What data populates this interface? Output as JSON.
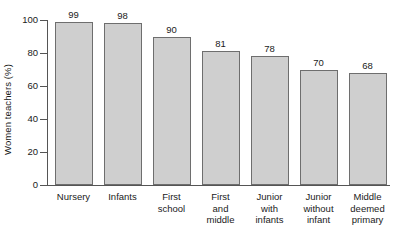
{
  "chart_data": {
    "type": "bar",
    "title": "",
    "xlabel": "",
    "ylabel": "Women teachers (%)",
    "ylim": [
      0,
      100
    ],
    "yticks": [
      0,
      20,
      40,
      60,
      80,
      100
    ],
    "grid": false,
    "legend": false,
    "categories": [
      "Nursery",
      "Infants",
      "First school",
      "First and middle",
      "Junior with infants",
      "Junior without infant",
      "Middle deemed primary"
    ],
    "category_lines": [
      [
        "Nursery"
      ],
      [
        "Infants"
      ],
      [
        "First",
        "school"
      ],
      [
        "First",
        "and",
        "middle"
      ],
      [
        "Junior",
        "with",
        "infants"
      ],
      [
        "Junior",
        "without",
        "infant"
      ],
      [
        "Middle",
        "deemed",
        "primary"
      ]
    ],
    "values": [
      99,
      98,
      90,
      81,
      78,
      70,
      68
    ],
    "value_labels": [
      "99",
      "98",
      "90",
      "81",
      "78",
      "70",
      "68"
    ],
    "ytick_labels": [
      "0",
      "20",
      "40",
      "60",
      "80",
      "100"
    ],
    "colors": {
      "bar_fill": "#cfcfcf",
      "bar_border": "#6e6e6e",
      "axis": "#555555",
      "text": "#1a1a1a",
      "background": "#ffffff"
    }
  }
}
